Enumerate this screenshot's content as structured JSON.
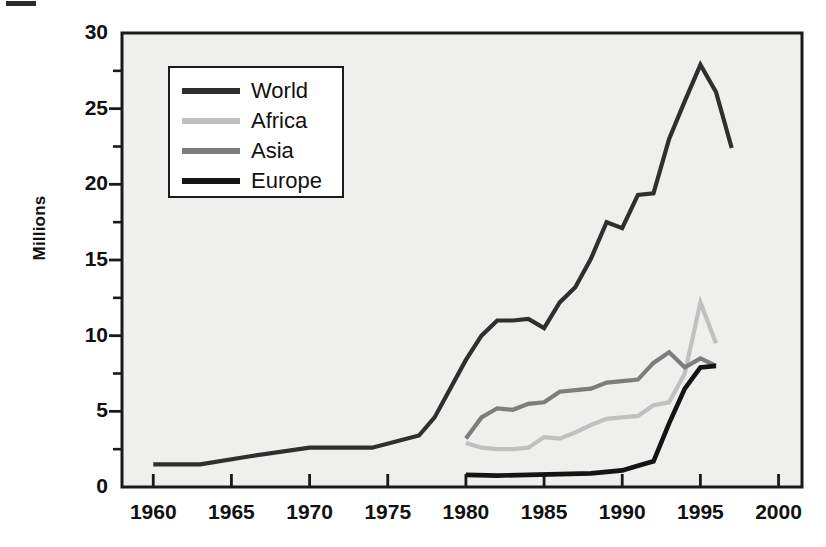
{
  "chart_data": {
    "type": "line",
    "title": "",
    "subtitle": "",
    "xlabel": "",
    "ylabel": "Millions",
    "xlim": [
      1958.0,
      2001.5
    ],
    "ylim": [
      0,
      30
    ],
    "xticks": [
      1960,
      1965,
      1970,
      1975,
      1980,
      1985,
      1990,
      1995,
      2000
    ],
    "xtick_labels": [
      "1960",
      "1965",
      "1970",
      "1975",
      "1980",
      "1985",
      "1990",
      "1995",
      "2000"
    ],
    "yticks": [
      0,
      5,
      10,
      15,
      20,
      25,
      30
    ],
    "ytick_labels": [
      "0",
      "5",
      "10",
      "15",
      "20",
      "25",
      "30"
    ],
    "yminor_ticks": [
      2.5,
      7.5,
      12.5,
      17.5,
      22.5,
      27.5
    ],
    "grid": false,
    "legend_position": "upper-left-inside",
    "plot_bg": "#efefed",
    "axis_color": "#1a1a1a",
    "series": [
      {
        "name": "World",
        "color": "#2f2f2f",
        "linewidth": 4.2,
        "x": [
          1960,
          1963,
          1966,
          1970,
          1974,
          1977,
          1978,
          1980,
          1981,
          1982,
          1983,
          1984,
          1985,
          1986,
          1987,
          1988,
          1989,
          1990,
          1991,
          1992,
          1993,
          1994,
          1995,
          1996,
          1997
        ],
        "y": [
          1.5,
          1.5,
          2.0,
          2.6,
          2.6,
          3.4,
          4.6,
          8.4,
          10.0,
          11.0,
          11.0,
          11.1,
          10.5,
          12.2,
          13.2,
          15.1,
          17.5,
          17.1,
          19.3,
          19.4,
          23.0,
          25.5,
          27.9,
          26.1,
          22.4
        ]
      },
      {
        "name": "Africa",
        "color": "#c0c0c0",
        "linewidth": 4.2,
        "x": [
          1980,
          1981,
          1982,
          1983,
          1984,
          1985,
          1986,
          1987,
          1988,
          1989,
          1990,
          1991,
          1992,
          1993,
          1994,
          1995,
          1996
        ],
        "y": [
          2.9,
          2.6,
          2.5,
          2.5,
          2.6,
          3.3,
          3.2,
          3.6,
          4.1,
          4.5,
          4.6,
          4.7,
          5.4,
          5.6,
          7.5,
          12.2,
          9.5
        ]
      },
      {
        "name": "Asia",
        "color": "#7d7d7d",
        "linewidth": 4.2,
        "x": [
          1980,
          1981,
          1982,
          1983,
          1984,
          1985,
          1986,
          1987,
          1988,
          1989,
          1990,
          1991,
          1992,
          1993,
          1994,
          1995,
          1996
        ],
        "y": [
          3.2,
          4.6,
          5.2,
          5.1,
          5.5,
          5.6,
          6.3,
          6.4,
          6.5,
          6.9,
          7.0,
          7.1,
          8.2,
          8.9,
          7.9,
          8.5,
          8.0
        ]
      },
      {
        "name": "Europe",
        "color": "#141414",
        "linewidth": 4.6,
        "x": [
          1980,
          1982,
          1984,
          1986,
          1988,
          1990,
          1991,
          1992,
          1993,
          1994,
          1995,
          1996
        ],
        "y": [
          0.8,
          0.75,
          0.8,
          0.85,
          0.9,
          1.1,
          1.4,
          1.7,
          4.2,
          6.5,
          7.9,
          8.0
        ]
      }
    ]
  },
  "legend": {
    "entries": [
      {
        "label": "World",
        "color": "#2f2f2f"
      },
      {
        "label": "Africa",
        "color": "#c0c0c0"
      },
      {
        "label": "Asia",
        "color": "#7d7d7d"
      },
      {
        "label": "Europe",
        "color": "#141414"
      }
    ]
  },
  "axis_label": {
    "y": "Millions"
  }
}
